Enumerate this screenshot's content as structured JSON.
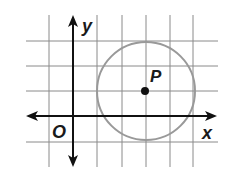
{
  "diagram": {
    "type": "coordinate-plane-circle",
    "labels": {
      "x_axis": "x",
      "y_axis": "y",
      "origin": "O",
      "center": "P"
    },
    "grid": {
      "x_lines": [
        49,
        73,
        97,
        122,
        146,
        170,
        193
      ],
      "y_lines": [
        41,
        66,
        91,
        116,
        142
      ]
    },
    "circle": {
      "center_grid": [
        3,
        1
      ],
      "radius_units": 2
    },
    "colors": {
      "grid": "#8a8a8a",
      "axis": "#111111",
      "circle": "#999999",
      "point": "#111111"
    }
  }
}
